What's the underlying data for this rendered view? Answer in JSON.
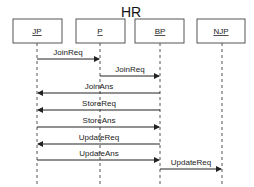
{
  "diagram": {
    "title": "HR",
    "type": "sequence",
    "actors": [
      {
        "id": "JP",
        "label": "JP",
        "x": 37
      },
      {
        "id": "P",
        "label": "P",
        "x": 100
      },
      {
        "id": "BP",
        "label": "BP",
        "x": 160
      },
      {
        "id": "NJP",
        "label": "NJP",
        "x": 222
      }
    ],
    "messages": [
      {
        "label": "JoinReq",
        "from": "JP",
        "to": "P",
        "y": 59
      },
      {
        "label": "JoinReq",
        "from": "P",
        "to": "BP",
        "y": 76
      },
      {
        "label": "JoinAns",
        "from": "BP",
        "to": "JP",
        "y": 93
      },
      {
        "label": "StoreReq",
        "from": "BP",
        "to": "JP",
        "y": 110
      },
      {
        "label": "StoreAns",
        "from": "JP",
        "to": "BP",
        "y": 127
      },
      {
        "label": "UpdateReq",
        "from": "BP",
        "to": "JP",
        "y": 144
      },
      {
        "label": "UpdateAns",
        "from": "JP",
        "to": "BP",
        "y": 160
      },
      {
        "label": "UpdateReq",
        "from": "BP",
        "to": "NJP",
        "y": 177
      }
    ]
  }
}
